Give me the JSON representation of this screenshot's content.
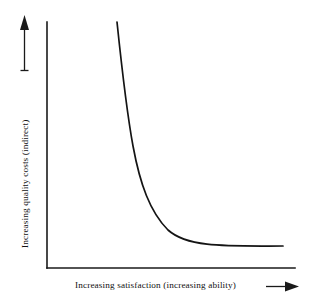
{
  "chart_data": {
    "type": "line",
    "title": "",
    "subtitle": "",
    "xlabel": "Increasing satisfaction (increasing ability)",
    "ylabel": "Increasing quality costs (indirect)",
    "xlabel_arrow": "right-arrow",
    "ylabel_arrow": "up-arrow",
    "grid": false,
    "legend": null,
    "legend_position": "none",
    "axis_ticks": [],
    "xtick_labels": [],
    "ytick_labels": [],
    "xlim": [
      0,
      1
    ],
    "ylim": [
      0,
      1
    ],
    "annotations": [],
    "series": [
      {
        "name": "Indirect quality costs",
        "description": "Hyperbolic decay: costs fall steeply then flatten asymptotically as satisfaction increases",
        "x": [
          0.28,
          0.3,
          0.32,
          0.34,
          0.36,
          0.4,
          0.45,
          0.5,
          0.56,
          0.62,
          0.7,
          0.8,
          0.9,
          1.0
        ],
        "y": [
          1.0,
          0.86,
          0.72,
          0.6,
          0.5,
          0.36,
          0.25,
          0.18,
          0.13,
          0.1,
          0.08,
          0.06,
          0.05,
          0.045
        ]
      }
    ],
    "curve_pixel_path": "M117,22 C122,70 126,108 133,146 C140,184 150,212 168,230 C188,248 228,246 283,246",
    "axes_pixels": {
      "origin_x": 47,
      "origin_y": 268,
      "x_axis_end_x": 295,
      "y_axis_top_y": 22
    },
    "colors": {
      "background": "#ffffff",
      "axis": "#1a1a1a",
      "curve": "#141414",
      "text": "#111111"
    }
  },
  "figure": {
    "xlabel_text": "Increasing satisfaction (increasing ability)",
    "ylabel_text": "Increasing quality costs (indirect)"
  }
}
